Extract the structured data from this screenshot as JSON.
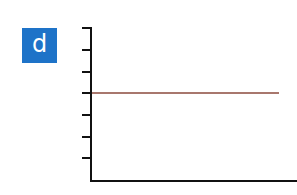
{
  "panel": {
    "label": "d",
    "label_bg": "#1e73c8",
    "label_color": "#ffffff"
  },
  "chart_data": {
    "type": "line",
    "title": "",
    "xlabel": "",
    "ylabel": "",
    "x_ticks": [],
    "y_ticks": 7,
    "y_tick_labels": [],
    "grid": false,
    "legend": null,
    "series": [
      {
        "name": "",
        "color": "#8b4a3c",
        "x": [
          0,
          1
        ],
        "y": [
          4,
          4
        ]
      }
    ],
    "ylim": [
      0,
      7
    ],
    "annotations": "Flat horizontal line at the 4th tick from the bottom; axes have no numeric labels"
  },
  "axis": {
    "color": "#111111",
    "x0": 91,
    "y_top": 28,
    "y_bottom": 181,
    "x_right": 297,
    "tick_ys": [
      28,
      50,
      72,
      93,
      115,
      137,
      158
    ],
    "tick_x0": 82
  },
  "line": {
    "x1": 92,
    "x2": 279,
    "y": 93
  }
}
